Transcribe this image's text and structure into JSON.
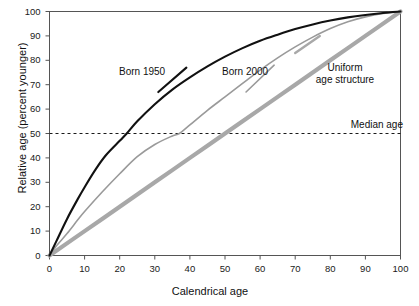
{
  "chart_data": {
    "type": "line",
    "title": "",
    "subtitle": "",
    "xlabel": "Calendrical age",
    "ylabel": "Relative age (percent younger)",
    "xlim": [
      0,
      100
    ],
    "ylim": [
      0,
      100
    ],
    "xticks": [
      0,
      10,
      20,
      30,
      40,
      50,
      60,
      70,
      80,
      90,
      100
    ],
    "yticks": [
      0,
      10,
      20,
      30,
      40,
      50,
      60,
      70,
      80,
      90,
      100
    ],
    "grid": false,
    "legend_position": "inline-labels",
    "annotations": [
      {
        "text": "Born 1950",
        "x": 22,
        "y": 72,
        "style": "curve-label"
      },
      {
        "text": "Born 2000",
        "x": 46,
        "y": 72,
        "style": "curve-label"
      },
      {
        "text": "Uniform\nage structure",
        "x": 72,
        "y": 76,
        "style": "curve-label"
      },
      {
        "text": "Median age",
        "x": 96,
        "y": 53,
        "style": "reference-label"
      }
    ],
    "reference_lines": [
      {
        "name": "Median age",
        "orientation": "horizontal",
        "y": 50,
        "dash": "3 3",
        "color": "#1a1a1a"
      }
    ],
    "series": [
      {
        "name": "Born 1950",
        "color": "#111111",
        "width": 2.1,
        "x": [
          0,
          2,
          5,
          8,
          10,
          13,
          16,
          20,
          22,
          25,
          30,
          35,
          40,
          45,
          50,
          55,
          60,
          65,
          70,
          75,
          80,
          85,
          90,
          95,
          100
        ],
        "y": [
          0,
          6,
          15,
          23,
          28,
          35,
          41,
          47,
          50,
          55,
          62,
          68,
          73,
          77.5,
          81.5,
          85,
          88,
          90.5,
          92.8,
          94.7,
          96.3,
          97.6,
          98.6,
          99.4,
          100
        ]
      },
      {
        "name": "Born 2000",
        "color": "#9a9a9a",
        "width": 1.6,
        "x": [
          0,
          2,
          5,
          8,
          10,
          15,
          20,
          25,
          30,
          35,
          37,
          40,
          45,
          50,
          55,
          60,
          65,
          70,
          75,
          80,
          85,
          90,
          95,
          100
        ],
        "y": [
          0,
          4,
          9,
          14.5,
          18,
          26,
          33.5,
          40.5,
          45.5,
          49,
          50,
          53.5,
          59.5,
          65,
          70.5,
          76,
          81,
          85.5,
          89.5,
          93,
          95.8,
          97.8,
          99.2,
          100
        ]
      },
      {
        "name": "Uniform age structure",
        "color": "#a8a8a8",
        "width": 4.2,
        "x": [
          0,
          10,
          20,
          30,
          40,
          50,
          60,
          70,
          80,
          90,
          100
        ],
        "y": [
          0,
          10,
          20,
          30,
          40,
          50,
          60,
          70,
          80,
          90,
          100
        ]
      }
    ],
    "leader_lines": [
      {
        "series": "Born 1950",
        "from_x": 31,
        "from_y": 67,
        "to_x": 39,
        "to_y": 77
      },
      {
        "series": "Born 2000",
        "from_x": 56,
        "from_y": 67,
        "to_x": 64,
        "to_y": 78
      },
      {
        "series": "Uniform age structure",
        "from_x": 70,
        "from_y": 83,
        "to_x": 77,
        "to_y": 90
      }
    ]
  },
  "axes": {
    "x_title": "Calendrical age",
    "y_title": "Relative age (percent younger)",
    "x_tick_labels": [
      "0",
      "10",
      "20",
      "30",
      "40",
      "50",
      "60",
      "70",
      "80",
      "90",
      "100"
    ],
    "y_tick_labels": [
      "0",
      "10",
      "20",
      "30",
      "40",
      "50",
      "60",
      "70",
      "80",
      "90",
      "100"
    ]
  },
  "labels": {
    "born_1950": "Born 1950",
    "born_2000": "Born 2000",
    "uniform_line1": "Uniform",
    "uniform_line2": "age structure",
    "median_age": "Median age"
  },
  "colors": {
    "born_1950": "#111111",
    "born_2000": "#9a9a9a",
    "uniform": "#a8a8a8",
    "frame": "#555555",
    "median_line": "#1a1a1a",
    "background": "#ffffff"
  }
}
